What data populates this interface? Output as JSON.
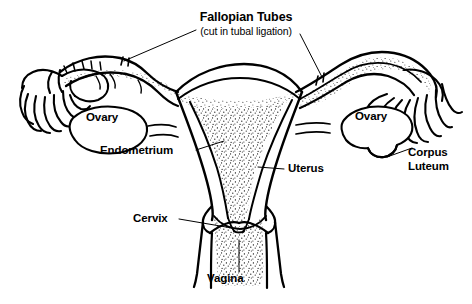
{
  "figure": {
    "kind": "anatomical-line-diagram",
    "background_color": "#ffffff",
    "ink_color": "#000000"
  },
  "title": {
    "main": "Fallopian Tubes",
    "sub": "(cut in tubal ligation)"
  },
  "labels": {
    "ovary_left": "Ovary",
    "ovary_right": "Ovary",
    "endometrium": "Endometrium",
    "uterus": "Uterus",
    "cervix": "Cervix",
    "vagina": "Vagina",
    "corpus_luteum_line1": "Corpus",
    "corpus_luteum_line2": "Luteum"
  },
  "structures": [
    "fallopian tube left",
    "fallopian tube right (cutaway, stippled lumen)",
    "fimbriae left",
    "fimbriae right",
    "ovary left",
    "ovary right",
    "corpus luteum",
    "uterine fundus",
    "endometrium",
    "uterine cavity (stippled)",
    "myometrium",
    "cervix",
    "vaginal canal (stippled)"
  ],
  "stipple": {
    "regions": [
      "uterine cavity",
      "right fallopian tube lumen",
      "vaginal canal",
      "endometrial lining"
    ],
    "dot_color": "#000000"
  }
}
